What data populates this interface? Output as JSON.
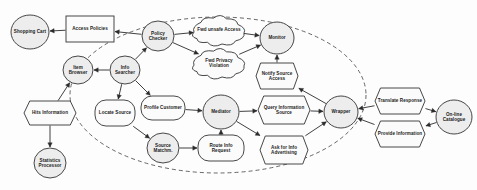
{
  "diagram": {
    "boundary": {
      "name": "system-boundary",
      "style": "dashed-ellipse",
      "cx": 218,
      "cy": 95,
      "rx": 148,
      "ry": 78
    },
    "colors": {
      "node_fill": "#ededed",
      "plain_fill": "#fbfbfb",
      "stroke": "#333333",
      "edge": "#2b2b2b",
      "boundary": "#4a4a4a",
      "background": "#fdfdfd"
    },
    "nodes": [
      {
        "id": "shopping-cart",
        "label": "Shopping Cart",
        "shape": "circle",
        "cx": 30,
        "cy": 32,
        "rx": 19,
        "ry": 17
      },
      {
        "id": "access-policies",
        "label": "Access Policies",
        "shape": "rect",
        "cx": 90,
        "cy": 29,
        "rx": 24,
        "ry": 13
      },
      {
        "id": "policy-checker",
        "label": "Policy Checker",
        "shape": "circle",
        "cx": 158,
        "cy": 36,
        "rx": 16,
        "ry": 15
      },
      {
        "id": "fwd-unsafe-access",
        "label": "Fwd unsafe Access",
        "shape": "cloud",
        "cx": 219,
        "cy": 30,
        "rx": 25,
        "ry": 14
      },
      {
        "id": "fwd-privacy-violation",
        "label": "Fwd Privacy Violation",
        "shape": "cloud",
        "cx": 219,
        "cy": 63,
        "rx": 25,
        "ry": 14
      },
      {
        "id": "monitor",
        "label": "Monitor",
        "shape": "circle",
        "cx": 277,
        "cy": 38,
        "rx": 17,
        "ry": 16
      },
      {
        "id": "notify-source-access",
        "label": "Notify Source Access",
        "shape": "hexagon",
        "cx": 277,
        "cy": 76,
        "rx": 21,
        "ry": 13
      },
      {
        "id": "item-browser",
        "label": "Item Browser",
        "shape": "circle",
        "cx": 78,
        "cy": 70,
        "rx": 15,
        "ry": 14
      },
      {
        "id": "info-searcher",
        "label": "Info Searcher",
        "shape": "circle",
        "cx": 125,
        "cy": 70,
        "rx": 15,
        "ry": 14
      },
      {
        "id": "hits-information",
        "label": "Hits Information",
        "shape": "hexagon",
        "cx": 50,
        "cy": 113,
        "rx": 26,
        "ry": 12
      },
      {
        "id": "statistics-processor",
        "label": "Statistics Processor",
        "shape": "circle",
        "cx": 50,
        "cy": 163,
        "rx": 16,
        "ry": 15
      },
      {
        "id": "locate-source",
        "label": "Locate Source",
        "shape": "roundrect",
        "cx": 115,
        "cy": 113,
        "rx": 20,
        "ry": 13
      },
      {
        "id": "profile-customer",
        "label": "Profile Customer",
        "shape": "roundrect",
        "cx": 163,
        "cy": 108,
        "rx": 22,
        "ry": 12
      },
      {
        "id": "source-matchm",
        "label": "Source Matchm.",
        "shape": "circle",
        "cx": 163,
        "cy": 148,
        "rx": 16,
        "ry": 15
      },
      {
        "id": "mediator",
        "label": "Mediator",
        "shape": "circle",
        "cx": 221,
        "cy": 112,
        "rx": 18,
        "ry": 17
      },
      {
        "id": "route-info-request",
        "label": "Route Info Request",
        "shape": "roundrect",
        "cx": 221,
        "cy": 148,
        "rx": 23,
        "ry": 13
      },
      {
        "id": "query-information-source",
        "label": "Query Information Source",
        "shape": "hexagon",
        "cx": 284,
        "cy": 110,
        "rx": 26,
        "ry": 14
      },
      {
        "id": "ask-for-info-advertising",
        "label": "Ask for Info Advertising",
        "shape": "hexagon",
        "cx": 284,
        "cy": 150,
        "rx": 24,
        "ry": 14
      },
      {
        "id": "wrapper",
        "label": "Wrapper",
        "shape": "circle",
        "cx": 341,
        "cy": 112,
        "rx": 17,
        "ry": 16
      },
      {
        "id": "translate-response",
        "label": "Translate Response",
        "shape": "hexagon",
        "cx": 400,
        "cy": 101,
        "rx": 25,
        "ry": 13
      },
      {
        "id": "provide-information",
        "label": "Provide Information",
        "shape": "hexagon",
        "cx": 400,
        "cy": 134,
        "rx": 25,
        "ry": 13
      },
      {
        "id": "on-line-catalogue",
        "label": "On-line Catalogue",
        "shape": "circle",
        "cx": 454,
        "cy": 117,
        "rx": 18,
        "ry": 17
      }
    ],
    "edges": [
      {
        "id": "e-access-to-cart",
        "from": "access-policies",
        "to": "shopping-cart"
      },
      {
        "id": "e-checker-to-policies",
        "from": "policy-checker",
        "to": "access-policies"
      },
      {
        "id": "e-checker-to-unsafe",
        "from": "policy-checker",
        "to": "fwd-unsafe-access"
      },
      {
        "id": "e-checker-to-privacy",
        "from": "policy-checker",
        "to": "fwd-privacy-violation"
      },
      {
        "id": "e-unsafe-to-monitor",
        "from": "fwd-unsafe-access",
        "to": "monitor"
      },
      {
        "id": "e-privacy-to-monitor",
        "from": "fwd-privacy-violation",
        "to": "monitor"
      },
      {
        "id": "e-notify-to-monitor",
        "from": "notify-source-access",
        "to": "monitor"
      },
      {
        "id": "e-wrapper-to-notify",
        "from": "wrapper",
        "to": "notify-source-access"
      },
      {
        "id": "e-searcher-to-checker",
        "from": "info-searcher",
        "to": "policy-checker"
      },
      {
        "id": "e-searcher-to-browser",
        "from": "info-searcher",
        "to": "item-browser"
      },
      {
        "id": "e-searcher-to-locate",
        "from": "info-searcher",
        "to": "locate-source"
      },
      {
        "id": "e-searcher-to-profile",
        "from": "info-searcher",
        "to": "profile-customer"
      },
      {
        "id": "e-hits-to-browser",
        "from": "hits-information",
        "to": "item-browser"
      },
      {
        "id": "e-hits-to-statistics",
        "from": "hits-information",
        "to": "statistics-processor"
      },
      {
        "id": "e-locate-to-matchm",
        "from": "locate-source",
        "to": "source-matchm"
      },
      {
        "id": "e-profile-to-mediator",
        "from": "profile-customer",
        "to": "mediator"
      },
      {
        "id": "e-matchm-to-route",
        "from": "source-matchm",
        "to": "route-info-request"
      },
      {
        "id": "e-route-to-mediator",
        "from": "route-info-request",
        "to": "mediator"
      },
      {
        "id": "e-mediator-to-query",
        "from": "mediator",
        "to": "query-information-source"
      },
      {
        "id": "e-mediator-to-ask",
        "from": "mediator",
        "to": "ask-for-info-advertising"
      },
      {
        "id": "e-query-to-wrapper",
        "from": "query-information-source",
        "to": "wrapper"
      },
      {
        "id": "e-ask-to-wrapper",
        "from": "ask-for-info-advertising",
        "to": "wrapper"
      },
      {
        "id": "e-translate-to-wrapper",
        "from": "translate-response",
        "to": "wrapper"
      },
      {
        "id": "e-provide-to-wrapper",
        "from": "provide-information",
        "to": "wrapper"
      },
      {
        "id": "e-translate-to-catalogue",
        "from": "translate-response",
        "to": "on-line-catalogue"
      },
      {
        "id": "e-catalogue-to-provide",
        "from": "on-line-catalogue",
        "to": "provide-information"
      }
    ]
  }
}
